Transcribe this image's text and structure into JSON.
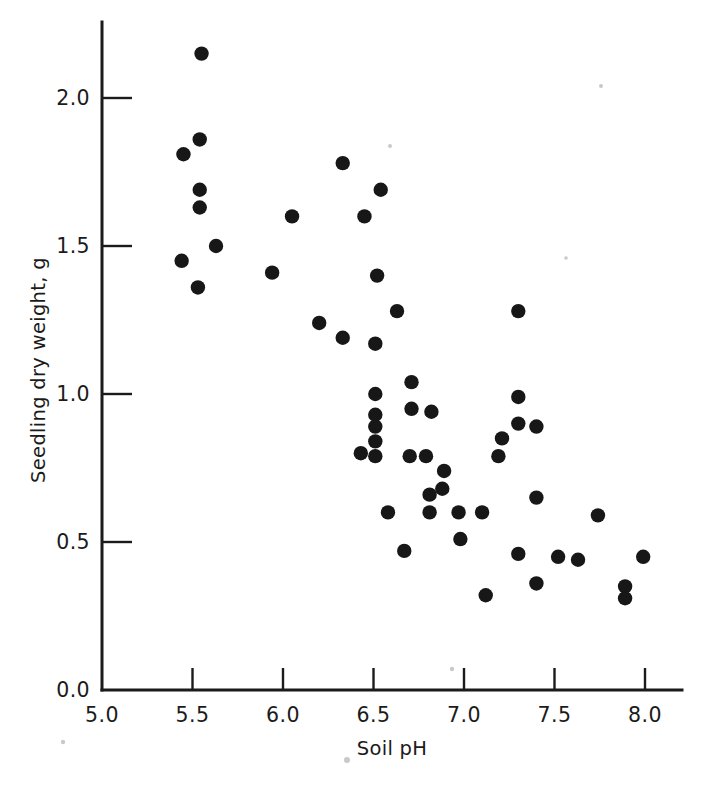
{
  "chart_data": {
    "type": "scatter",
    "title": "",
    "xlabel": "Soil pH",
    "ylabel": "Seedling dry weight, g",
    "xlim": [
      5.0,
      8.1
    ],
    "ylim": [
      0.0,
      2.25
    ],
    "xticks": [
      5.0,
      5.5,
      6.0,
      6.5,
      7.0,
      7.5,
      8.0
    ],
    "xticklabels": [
      "5.0",
      "5.5",
      "6.0",
      "6.5",
      "7.0",
      "7.5",
      "8.0"
    ],
    "yticks": [
      0.0,
      0.5,
      1.0,
      1.5,
      2.0
    ],
    "yticklabels": [
      "0.0",
      "0.5",
      "1.0",
      "1.5",
      "2.0"
    ],
    "grid": false,
    "legend": null,
    "marker": "filled-circle",
    "marker_color": "#171717",
    "points": [
      {
        "x": 5.55,
        "y": 2.15
      },
      {
        "x": 5.54,
        "y": 1.86
      },
      {
        "x": 5.45,
        "y": 1.81
      },
      {
        "x": 5.54,
        "y": 1.69
      },
      {
        "x": 5.54,
        "y": 1.63
      },
      {
        "x": 5.63,
        "y": 1.5
      },
      {
        "x": 5.44,
        "y": 1.45
      },
      {
        "x": 5.53,
        "y": 1.36
      },
      {
        "x": 6.33,
        "y": 1.78
      },
      {
        "x": 6.54,
        "y": 1.69
      },
      {
        "x": 6.05,
        "y": 1.6
      },
      {
        "x": 6.45,
        "y": 1.6
      },
      {
        "x": 5.94,
        "y": 1.41
      },
      {
        "x": 6.52,
        "y": 1.4
      },
      {
        "x": 6.2,
        "y": 1.24
      },
      {
        "x": 6.63,
        "y": 1.28
      },
      {
        "x": 6.33,
        "y": 1.19
      },
      {
        "x": 6.51,
        "y": 1.17
      },
      {
        "x": 6.71,
        "y": 1.04
      },
      {
        "x": 6.51,
        "y": 1.0
      },
      {
        "x": 6.71,
        "y": 0.95
      },
      {
        "x": 6.82,
        "y": 0.94
      },
      {
        "x": 6.51,
        "y": 0.93
      },
      {
        "x": 6.51,
        "y": 0.89
      },
      {
        "x": 6.51,
        "y": 0.84
      },
      {
        "x": 6.43,
        "y": 0.8
      },
      {
        "x": 6.51,
        "y": 0.79
      },
      {
        "x": 6.7,
        "y": 0.79
      },
      {
        "x": 6.79,
        "y": 0.79
      },
      {
        "x": 6.89,
        "y": 0.74
      },
      {
        "x": 6.88,
        "y": 0.68
      },
      {
        "x": 6.81,
        "y": 0.66
      },
      {
        "x": 6.81,
        "y": 0.6
      },
      {
        "x": 6.58,
        "y": 0.6
      },
      {
        "x": 6.97,
        "y": 0.6
      },
      {
        "x": 6.98,
        "y": 0.51
      },
      {
        "x": 6.67,
        "y": 0.47
      },
      {
        "x": 7.3,
        "y": 1.28
      },
      {
        "x": 7.3,
        "y": 0.99
      },
      {
        "x": 7.3,
        "y": 0.9
      },
      {
        "x": 7.4,
        "y": 0.89
      },
      {
        "x": 7.21,
        "y": 0.85
      },
      {
        "x": 7.19,
        "y": 0.79
      },
      {
        "x": 7.4,
        "y": 0.65
      },
      {
        "x": 7.1,
        "y": 0.6
      },
      {
        "x": 7.74,
        "y": 0.59
      },
      {
        "x": 7.3,
        "y": 0.46
      },
      {
        "x": 7.52,
        "y": 0.45
      },
      {
        "x": 7.99,
        "y": 0.45
      },
      {
        "x": 7.63,
        "y": 0.44
      },
      {
        "x": 7.4,
        "y": 0.36
      },
      {
        "x": 7.89,
        "y": 0.35
      },
      {
        "x": 7.12,
        "y": 0.32
      },
      {
        "x": 7.89,
        "y": 0.31
      }
    ]
  },
  "axes": {
    "x_title": "Soil pH",
    "y_title": "Seedling dry weight, g"
  }
}
